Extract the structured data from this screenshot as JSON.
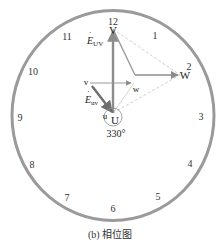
{
  "diagram": {
    "title": "相位图",
    "caption": "(b) 相位图",
    "clock_face": {
      "numerals": [
        "12",
        "1",
        "2",
        "3",
        "4",
        "5",
        "6",
        "7",
        "8",
        "9",
        "10",
        "11"
      ],
      "stroke_color": "#9a9a9a"
    },
    "primary_vertices": {
      "U": "U",
      "V": "V",
      "W": "W"
    },
    "secondary_vertices": {
      "u": "u",
      "v": "v",
      "w": "w"
    },
    "phasors": {
      "primary_emf": {
        "symbol": "E",
        "subscript": "UV"
      },
      "secondary_emf": {
        "symbol": "E",
        "subscript": "uv"
      }
    },
    "phase_angle": "330°",
    "colors": {
      "phasor": "#8c8c8c",
      "dashed": "#bdbdbd",
      "text": "#222222"
    }
  }
}
